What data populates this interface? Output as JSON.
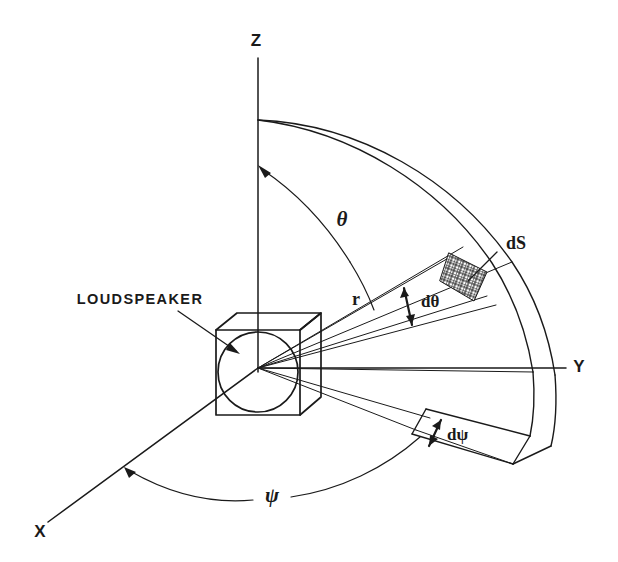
{
  "figure": {
    "kind": "technical-diagram",
    "background_color": "#ffffff",
    "ink_color": "#1a1a1a",
    "width": 618,
    "height": 562
  },
  "axes": [
    {
      "id": "z",
      "label": "Z",
      "label_x": 256,
      "label_y": 42,
      "description": "vertical polar axis pointing up"
    },
    {
      "id": "y",
      "label": "Y",
      "label_x": 579,
      "label_y": 368,
      "description": "horizontal axis pointing right"
    },
    {
      "id": "x",
      "label": "X",
      "label_x": 40,
      "label_y": 533,
      "description": "oblique axis toward lower-left viewer"
    }
  ],
  "angles": [
    {
      "id": "theta",
      "label": "θ",
      "label_x": 342,
      "label_y": 221,
      "meaning": "polar angle measured from Z axis"
    },
    {
      "id": "psi",
      "label": "ψ",
      "label_x": 272,
      "label_y": 497,
      "meaning": "azimuth angle measured from X axis"
    },
    {
      "id": "dtheta",
      "label": "dθ",
      "label_x": 421,
      "label_y": 303,
      "meaning": "differential polar angle"
    },
    {
      "id": "dpsi",
      "label": "dψ",
      "label_x": 449,
      "label_y": 436,
      "meaning": "differential azimuth angle"
    }
  ],
  "quantities": [
    {
      "id": "r",
      "label": "r",
      "label_x": 356,
      "label_y": 301,
      "meaning": "radial distance from source to surface element"
    },
    {
      "id": "dS",
      "label": "dS",
      "label_x": 506,
      "label_y": 245,
      "meaning": "differential surface area element on the sphere"
    }
  ],
  "objects": [
    {
      "id": "loudspeaker",
      "label": "LOUDSPEAKER",
      "label_x": 140,
      "label_y": 300,
      "description": "cubic enclosure with circular driver at the coordinate origin",
      "leader_from": [
        178,
        311
      ],
      "leader_to": [
        236,
        351
      ]
    },
    {
      "id": "surface-patch",
      "label": "dS",
      "description": "cross-hatched differential patch on the spherical shell",
      "hatch": "cross-hatch"
    },
    {
      "id": "spherical-shell",
      "description": "solid-angle wedge of a spherical shell subtended by dθ and dψ"
    }
  ],
  "origin": {
    "x": 258,
    "y": 368
  }
}
